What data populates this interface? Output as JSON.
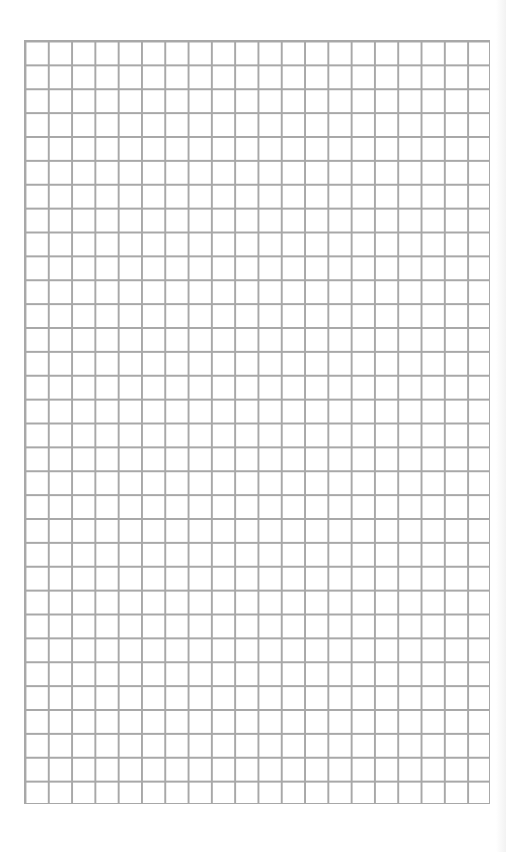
{
  "page": {
    "type": "graph-paper",
    "grid": {
      "columns": 20,
      "rows": 32,
      "line_color": "#a8a8a8",
      "background_color": "#ffffff"
    }
  }
}
